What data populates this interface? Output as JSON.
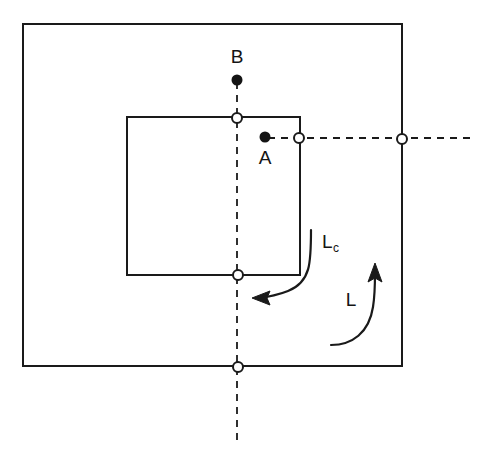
{
  "diagram": {
    "canvas": {
      "width": 498,
      "height": 457,
      "background": "#ffffff"
    },
    "stroke_color": "#1a1a1a",
    "labels": {
      "point_b": "B",
      "point_a": "A",
      "lc_base": "L",
      "lc_subscript": "c",
      "l_arrow": "L"
    },
    "shapes": {
      "outer_square": {
        "x": 23,
        "y": 24,
        "width": 379,
        "height": 342
      },
      "inner_square": {
        "x": 127,
        "y": 117,
        "width": 173,
        "height": 158
      }
    },
    "points": {
      "filled": [
        {
          "name": "B",
          "cx": 237,
          "cy": 80,
          "r": 5
        },
        {
          "name": "A",
          "cx": 265,
          "cy": 137,
          "r": 5
        }
      ],
      "open": [
        {
          "name": "inner-top-crossing",
          "cx": 237,
          "cy": 118,
          "r": 5
        },
        {
          "name": "inner-bottom-crossing",
          "cx": 238,
          "cy": 275,
          "r": 5
        },
        {
          "name": "outer-bottom-crossing",
          "cx": 238,
          "cy": 367,
          "r": 5
        },
        {
          "name": "inner-right-crossing",
          "cx": 299,
          "cy": 138,
          "r": 5
        },
        {
          "name": "outer-right-crossing",
          "cx": 402,
          "cy": 139,
          "r": 5
        }
      ]
    },
    "axes": {
      "vertical_dashed": {
        "x": 237,
        "y1": 82,
        "y2": 445
      },
      "horizontal_dashed": {
        "y": 138,
        "x1": 268,
        "x2": 476
      }
    },
    "arrows": {
      "lc": {
        "direction": "counterclockwise-left",
        "label": "Lc"
      },
      "l": {
        "direction": "counterclockwise-up",
        "label": "L"
      }
    }
  }
}
